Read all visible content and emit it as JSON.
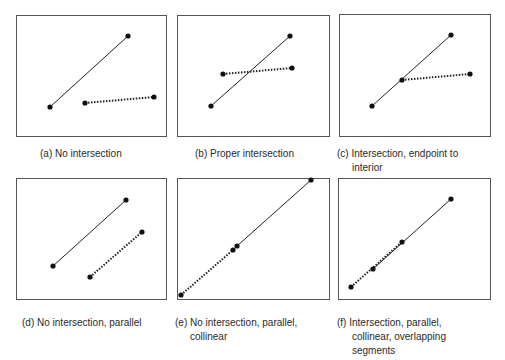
{
  "colors": {
    "stroke": "#222222",
    "frame": "#555555",
    "point": "#111111",
    "background": "#ffffff"
  },
  "panels": [
    {
      "id": "a",
      "tag": "(a)",
      "caption": [
        "No intersection"
      ],
      "segments": [
        {
          "style": "solid",
          "p1": [
            50,
            107
          ],
          "p2": [
            128,
            36
          ]
        },
        {
          "style": "dotted",
          "p1": [
            85,
            103
          ],
          "p2": [
            154,
            97
          ]
        }
      ],
      "points": [
        [
          50,
          107
        ],
        [
          128,
          36
        ],
        [
          85,
          103
        ],
        [
          154,
          97
        ]
      ]
    },
    {
      "id": "b",
      "tag": "(b)",
      "caption": [
        "Proper intersection"
      ],
      "segments": [
        {
          "style": "solid",
          "p1": [
            211,
            106
          ],
          "p2": [
            290,
            36
          ]
        },
        {
          "style": "dotted",
          "p1": [
            223,
            74
          ],
          "p2": [
            292,
            68
          ]
        }
      ],
      "points": [
        [
          211,
          106
        ],
        [
          290,
          36
        ],
        [
          223,
          74
        ],
        [
          292,
          68
        ]
      ]
    },
    {
      "id": "c",
      "tag": "(c)",
      "caption": [
        "Intersection, endpoint to",
        "interior"
      ],
      "segments": [
        {
          "style": "solid",
          "p1": [
            372,
            106
          ],
          "p2": [
            451,
            35
          ]
        },
        {
          "style": "dotted",
          "p1": [
            402,
            80
          ],
          "p2": [
            470,
            74
          ]
        }
      ],
      "points": [
        [
          372,
          106
        ],
        [
          451,
          35
        ],
        [
          402,
          80
        ],
        [
          470,
          74
        ]
      ]
    },
    {
      "id": "d",
      "tag": "(d)",
      "caption": [
        "No intersection, parallel"
      ],
      "segments": [
        {
          "style": "solid",
          "p1": [
            53,
            266
          ],
          "p2": [
            126,
            200
          ]
        },
        {
          "style": "dotted",
          "p1": [
            90,
            277
          ],
          "p2": [
            142,
            232
          ]
        }
      ],
      "points": [
        [
          53,
          266
        ],
        [
          126,
          200
        ],
        [
          90,
          277
        ],
        [
          142,
          232
        ]
      ]
    },
    {
      "id": "e",
      "tag": "(e)",
      "caption": [
        "No intersection, parallel,",
        "collinear"
      ],
      "segments": [
        {
          "style": "solid",
          "p1": [
            237,
            246
          ],
          "p2": [
            311,
            180
          ]
        },
        {
          "style": "dotted",
          "p1": [
            181,
            295
          ],
          "p2": [
            233,
            250
          ]
        }
      ],
      "points": [
        [
          237,
          246
        ],
        [
          311,
          180
        ],
        [
          181,
          295
        ],
        [
          233,
          250
        ]
      ]
    },
    {
      "id": "f",
      "tag": "(f)",
      "caption": [
        "Intersection, parallel,",
        "collinear, overlapping",
        "segments"
      ],
      "segments": [
        {
          "style": "solid",
          "p1": [
            373,
            269
          ],
          "p2": [
            451,
            199
          ]
        },
        {
          "style": "dotted",
          "p1": [
            351,
            287
          ],
          "p2": [
            402,
            242
          ]
        }
      ],
      "points": [
        [
          373,
          269
        ],
        [
          451,
          199
        ],
        [
          351,
          287
        ],
        [
          402,
          242
        ]
      ]
    }
  ]
}
